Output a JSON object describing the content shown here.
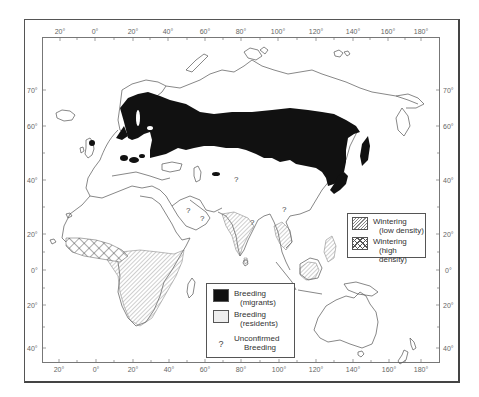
{
  "figure": {
    "type": "distribution map",
    "top_longitude_labels": [
      "20°",
      "0°",
      "20°",
      "40°",
      "60°",
      "80°",
      "100°",
      "120°",
      "140°",
      "160°",
      "180°"
    ],
    "bottom_longitude_labels": [
      "20°",
      "0°",
      "20°",
      "40°",
      "60°",
      "80°",
      "100°",
      "120°",
      "140°",
      "160°",
      "180°"
    ],
    "left_latitude_labels": [
      "70°",
      "60°",
      "40°",
      "20°",
      "0°",
      "20°",
      "40°"
    ],
    "right_latitude_labels": [
      "70°",
      "60°",
      "40°",
      "20°",
      "0°",
      "20°",
      "40°"
    ]
  },
  "legend_breeding": {
    "items": [
      {
        "label": "Breeding",
        "sub": "(migrants)",
        "pattern": "solid-black"
      },
      {
        "label": "Breeding",
        "sub": "(residents)",
        "pattern": "stipple"
      },
      {
        "label": "Unconfirmed",
        "sub": "Breeding",
        "symbol": "?"
      }
    ]
  },
  "legend_wintering": {
    "items": [
      {
        "label": "Wintering",
        "sub": "(low density)",
        "pattern": "diagonal-hatch"
      },
      {
        "label": "Wintering",
        "sub": "(high density)",
        "pattern": "crosshatch"
      }
    ]
  },
  "map_marks": {
    "unconfirmed_symbol": "?"
  },
  "colors": {
    "breeding_migrants": "#111111",
    "coastline": "#555555",
    "frame": "#555555"
  }
}
